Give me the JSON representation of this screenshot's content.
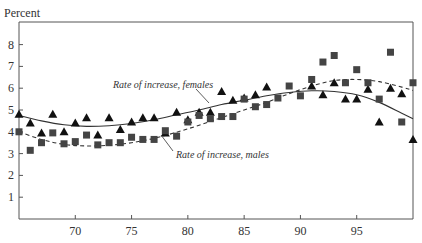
{
  "chart_data": {
    "type": "scatter",
    "title": "",
    "ylabel": "Percent",
    "xlabel": "",
    "xlim": [
      65,
      100
    ],
    "ylim": [
      0,
      9
    ],
    "grid": false,
    "x_ticks": [
      70,
      75,
      80,
      85,
      90,
      95
    ],
    "x_tick_labels": [
      "70",
      "75",
      "80",
      "85",
      "90",
      "95"
    ],
    "y_ticks": [
      1,
      2,
      3,
      4,
      5,
      6,
      7,
      8
    ],
    "y_tick_labels": [
      "1",
      "2",
      "3",
      "4",
      "5",
      "6",
      "7",
      "8"
    ],
    "series": [
      {
        "name": "Rate of increase, females",
        "marker": "triangle",
        "trend_style": "solid",
        "x": [
          65,
          66,
          67,
          68,
          69,
          70,
          71,
          72,
          73,
          74,
          75,
          76,
          77,
          78,
          79,
          80,
          81,
          82,
          83,
          84,
          85,
          86,
          87,
          91,
          92,
          93,
          94,
          95,
          96,
          97,
          98,
          99,
          100
        ],
        "values": [
          4.8,
          4.4,
          3.95,
          4.8,
          4.0,
          4.4,
          4.65,
          3.85,
          4.65,
          4.1,
          4.45,
          4.65,
          4.65,
          3.95,
          4.9,
          4.55,
          4.9,
          4.9,
          5.85,
          5.45,
          5.55,
          5.7,
          6.05,
          6.1,
          5.7,
          6.25,
          5.5,
          5.5,
          5.95,
          4.45,
          6.0,
          5.75,
          3.65
        ],
        "trend": {
          "x": [
            65,
            67,
            69,
            71,
            73,
            75,
            77,
            79,
            81,
            83,
            85,
            87,
            89,
            91,
            93,
            95,
            97,
            99,
            100
          ],
          "values": [
            4.75,
            4.5,
            4.32,
            4.25,
            4.28,
            4.38,
            4.55,
            4.78,
            5.0,
            5.25,
            5.45,
            5.65,
            5.8,
            5.88,
            5.85,
            5.7,
            5.35,
            4.85,
            4.6
          ]
        }
      },
      {
        "name": "Rate of increase, males",
        "marker": "square",
        "trend_style": "dashed",
        "x": [
          65,
          66,
          67,
          68,
          69,
          70,
          71,
          72,
          73,
          74,
          75,
          76,
          77,
          78,
          79,
          80,
          81,
          82,
          83,
          84,
          85,
          86,
          87,
          88,
          89,
          90,
          91,
          92,
          93,
          94,
          95,
          96,
          97,
          98,
          99,
          100
        ],
        "values": [
          4.0,
          3.15,
          3.5,
          3.95,
          3.45,
          3.55,
          3.85,
          3.4,
          3.5,
          3.5,
          3.75,
          3.65,
          3.65,
          4.05,
          3.8,
          4.45,
          4.75,
          4.6,
          4.7,
          4.7,
          5.5,
          5.15,
          5.25,
          5.55,
          6.1,
          5.65,
          6.4,
          7.2,
          7.5,
          6.25,
          6.85,
          6.25,
          5.5,
          7.65,
          4.45,
          6.25
        ],
        "trend": {
          "x": [
            65,
            67,
            69,
            71,
            73,
            75,
            77,
            79,
            81,
            83,
            85,
            87,
            89,
            91,
            93,
            95,
            97,
            99,
            100
          ],
          "values": [
            4.0,
            3.65,
            3.42,
            3.35,
            3.38,
            3.5,
            3.7,
            3.98,
            4.3,
            4.65,
            5.0,
            5.35,
            5.75,
            6.1,
            6.35,
            6.4,
            6.3,
            6.05,
            5.9
          ]
        }
      }
    ],
    "annotations": [
      {
        "text": "Rate of increase, females",
        "x_px": 113,
        "y_px": 88,
        "pointer_from": [
          196,
          89
        ],
        "pointer_to": [
          209,
          103
        ]
      },
      {
        "text": "Rate of increase, males",
        "x_px": 176,
        "y_px": 158,
        "pointer_from": [
          173,
          151
        ],
        "pointer_to": [
          161,
          135
        ]
      }
    ]
  },
  "labels": {
    "y_axis_title": "Percent"
  }
}
